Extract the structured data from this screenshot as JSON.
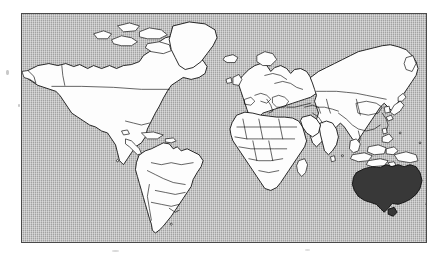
{
  "figure": {
    "type": "world-map",
    "title": "World map with Australia highlighted",
    "projection": "rectangular (Miller / equirectangular style)",
    "caption": "",
    "style": "scanned halftone line map, gray dithered ocean, white landmasses, black country borders"
  },
  "colors": {
    "ocean": "#b4b4b4",
    "land_fill": "#fdfdfd",
    "land_stroke": "#111111",
    "highlight_fill": "#383838",
    "frame_border": "#4a4a4a",
    "page_background": "#ffffff"
  },
  "frame": {
    "left": 21,
    "top": 13,
    "width": 406,
    "height": 230,
    "border_width": 1
  },
  "legend": {
    "visible": false,
    "entries": [
      {
        "label": "Highlighted country",
        "swatch": "#383838"
      },
      {
        "label": "Other land",
        "swatch": "#fdfdfd"
      },
      {
        "label": "Ocean",
        "swatch": "#b4b4b4"
      }
    ]
  },
  "highlighted_regions": [
    {
      "name": "Australia",
      "fill": "#383838"
    }
  ],
  "landmasses": [
    {
      "name": "North America",
      "fill": "#fdfdfd",
      "has_internal_borders": true
    },
    {
      "name": "Greenland",
      "fill": "#fdfdfd",
      "has_internal_borders": false
    },
    {
      "name": "South America",
      "fill": "#fdfdfd",
      "has_internal_borders": true
    },
    {
      "name": "Europe",
      "fill": "#fdfdfd",
      "has_internal_borders": true
    },
    {
      "name": "Africa",
      "fill": "#fdfdfd",
      "has_internal_borders": true
    },
    {
      "name": "Asia",
      "fill": "#fdfdfd",
      "has_internal_borders": true
    },
    {
      "name": "Australia",
      "fill": "#383838",
      "has_internal_borders": false
    },
    {
      "name": "Iceland",
      "fill": "#fdfdfd",
      "has_internal_borders": false
    },
    {
      "name": "Madagascar",
      "fill": "#fdfdfd",
      "has_internal_borders": false
    },
    {
      "name": "New Zealand",
      "fill": "#fdfdfd",
      "has_internal_borders": false
    },
    {
      "name": "Japan",
      "fill": "#fdfdfd",
      "has_internal_borders": false
    },
    {
      "name": "Indonesia",
      "fill": "#fdfdfd",
      "has_internal_borders": false
    },
    {
      "name": "Philippines",
      "fill": "#fdfdfd",
      "has_internal_borders": false
    },
    {
      "name": "New Guinea",
      "fill": "#fdfdfd",
      "has_internal_borders": false
    },
    {
      "name": "British Isles",
      "fill": "#fdfdfd",
      "has_internal_borders": false
    },
    {
      "name": "Sri Lanka",
      "fill": "#fdfdfd",
      "has_internal_borders": false
    },
    {
      "name": "Cuba",
      "fill": "#fdfdfd",
      "has_internal_borders": false
    },
    {
      "name": "Canadian Arctic Archipelago",
      "fill": "#fdfdfd",
      "has_internal_borders": false
    }
  ],
  "labels": {
    "map_labels_visible": false,
    "axis_labels_visible": false,
    "graticule_visible": false
  }
}
